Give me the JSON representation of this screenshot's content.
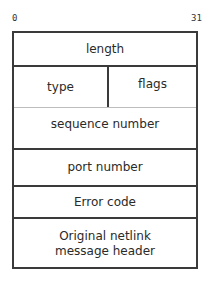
{
  "diagram": {
    "bit_labels": {
      "start": "0",
      "end": "31"
    },
    "fields": {
      "length": "length",
      "type": "type",
      "flags": "flags",
      "sequence_number": "sequence number",
      "port_number": "port number",
      "error_code": "Error code",
      "original_header_line1": "Original netlink",
      "original_header_line2": "message header"
    }
  }
}
